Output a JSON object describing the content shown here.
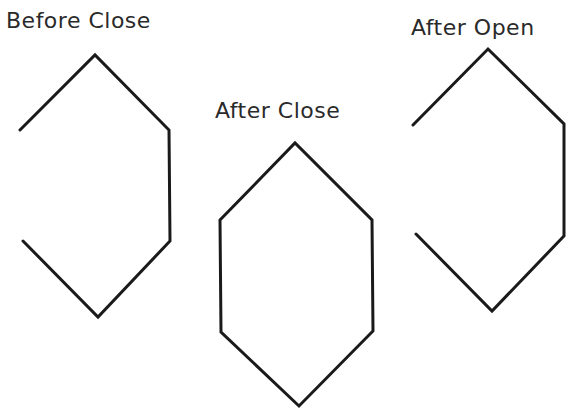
{
  "diagram": {
    "panels": [
      {
        "id": "before-close",
        "label": "Before Close",
        "label_pos": [
          6,
          10
        ],
        "points": [
          [
            20,
            130
          ],
          [
            95,
            55
          ],
          [
            169,
            130
          ],
          [
            170,
            241
          ],
          [
            98,
            317
          ],
          [
            23,
            241
          ]
        ],
        "closed": false
      },
      {
        "id": "after-close",
        "label": "After Close",
        "label_pos": [
          215,
          100
        ],
        "points": [
          [
            220,
            220
          ],
          [
            295,
            143
          ],
          [
            372,
            220
          ],
          [
            373,
            331
          ],
          [
            299,
            406
          ],
          [
            221,
            332
          ]
        ],
        "closed": true
      },
      {
        "id": "after-open",
        "label": "After Open",
        "label_pos": [
          411,
          17
        ],
        "points": [
          [
            413,
            125
          ],
          [
            488,
            49
          ],
          [
            564,
            124
          ],
          [
            564,
            236
          ],
          [
            492,
            311
          ],
          [
            416,
            234
          ]
        ],
        "closed": false
      }
    ],
    "stroke_color": "#1a1a1a",
    "text_color": "#2a2a2a"
  }
}
